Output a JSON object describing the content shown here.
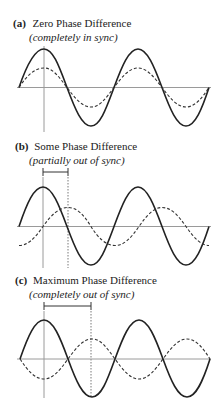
{
  "panels": [
    {
      "tag": "(a)",
      "title": "Zero Phase Difference",
      "subtitle": "(completely in sync)",
      "phase_shift_deg": 0,
      "solid_wave": {
        "amplitude": "large",
        "style": "solid"
      },
      "dashed_wave": {
        "amplitude": "small",
        "style": "dashed",
        "relation": "in phase"
      }
    },
    {
      "tag": "(b)",
      "title": "Some Phase Difference",
      "subtitle": "(partially out of sync)",
      "phase_shift_deg": 90,
      "solid_wave": {
        "amplitude": "large",
        "style": "solid"
      },
      "dashed_wave": {
        "amplitude": "small",
        "style": "dashed",
        "relation": "lagging by quarter cycle"
      },
      "bracket": "phase offset marker"
    },
    {
      "tag": "(c)",
      "title": "Maximum Phase Difference",
      "subtitle": "(completely out of sync)",
      "phase_shift_deg": 180,
      "solid_wave": {
        "amplitude": "large",
        "style": "solid"
      },
      "dashed_wave": {
        "amplitude": "small",
        "style": "dashed",
        "relation": "inverted"
      },
      "bracket": "phase offset marker"
    }
  ],
  "colors": {
    "line": "#222222",
    "axis": "#9a9a9a",
    "background": "#ffffff"
  }
}
